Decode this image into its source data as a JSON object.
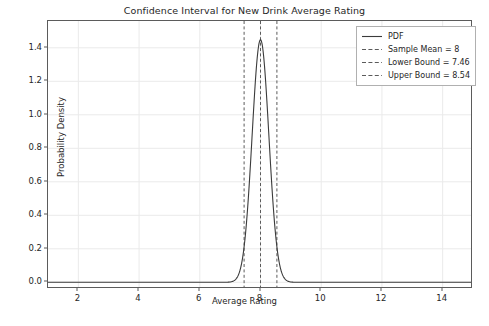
{
  "chart_data": {
    "type": "line",
    "title": "Confidence Interval for New Drink Average Rating",
    "xlabel": "Average Rating",
    "ylabel": "Probability Density",
    "xlim": [
      1.0,
      15.0
    ],
    "ylim": [
      -0.04,
      1.56
    ],
    "xticks": [
      2,
      4,
      6,
      8,
      10,
      12,
      14
    ],
    "yticks": [
      0.0,
      0.2,
      0.4,
      0.6,
      0.8,
      1.0,
      1.2,
      1.4
    ],
    "xtick_labels": [
      "2",
      "4",
      "6",
      "8",
      "10",
      "12",
      "14"
    ],
    "ytick_labels": [
      "0.0",
      "0.2",
      "0.4",
      "0.6",
      "0.8",
      "1.0",
      "1.2",
      "1.4"
    ],
    "grid": true,
    "legend_position": "upper right",
    "distribution": {
      "kind": "normal_pdf",
      "mean": 8.0,
      "std": 0.2755,
      "peak_density": 1.4479
    },
    "series": [
      {
        "name": "PDF",
        "style": "solid",
        "color": "#3b3b3b",
        "x": [
          1.0,
          2.0,
          3.0,
          4.0,
          5.0,
          5.5,
          6.0,
          6.25,
          6.5,
          6.75,
          7.0,
          7.1,
          7.2,
          7.3,
          7.4,
          7.46,
          7.5,
          7.6,
          7.7,
          7.8,
          7.9,
          8.0,
          8.1,
          8.2,
          8.3,
          8.4,
          8.5,
          8.54,
          8.6,
          8.7,
          8.8,
          8.9,
          9.0,
          9.25,
          9.5,
          9.75,
          10.0,
          10.5,
          11.0,
          12.0,
          13.0,
          14.0,
          15.0
        ],
        "y": [
          0.0,
          0.0,
          0.0,
          0.0,
          0.0,
          0.0,
          0.0,
          0.0,
          0.0,
          0.0002,
          0.0028,
          0.0064,
          0.0137,
          0.0277,
          0.0527,
          0.0739,
          0.0944,
          0.1596,
          0.2548,
          0.3837,
          0.5454,
          0.7317,
          0.9263,
          1.1069,
          1.2498,
          1.3368,
          1.361,
          1.3516,
          1.3222,
          1.2266,
          1.0838,
          0.9147,
          0.7408,
          0.3468,
          0.118,
          0.0287,
          0.005,
          4e-05,
          0.0,
          0.0,
          0.0,
          0.0,
          0.0
        ]
      }
    ],
    "vlines": [
      {
        "name": "Sample Mean",
        "x": 8.0,
        "style": "dashed",
        "color": "#5b5b5b",
        "label": "Sample Mean = 8"
      },
      {
        "name": "Lower Bound",
        "x": 7.46,
        "style": "dashed",
        "color": "#5b5b5b",
        "label": "Lower Bound = 7.46"
      },
      {
        "name": "Upper Bound",
        "x": 8.54,
        "style": "dashed",
        "color": "#5b5b5b",
        "label": "Upper Bound = 8.54"
      }
    ],
    "legend": [
      {
        "label": "PDF",
        "style": "solid"
      },
      {
        "label": "Sample Mean = 8",
        "style": "dashed"
      },
      {
        "label": "Lower Bound = 7.46",
        "style": "dashed"
      },
      {
        "label": "Upper Bound = 8.54",
        "style": "dashed"
      }
    ]
  },
  "colors": {
    "background": "#ffffff",
    "axis": "#5b5b5b",
    "grid": "#eaeaea",
    "curve": "#3b3b3b",
    "vline": "#5b5b5b",
    "text": "#262626",
    "legend_border": "#b0b0b0"
  }
}
